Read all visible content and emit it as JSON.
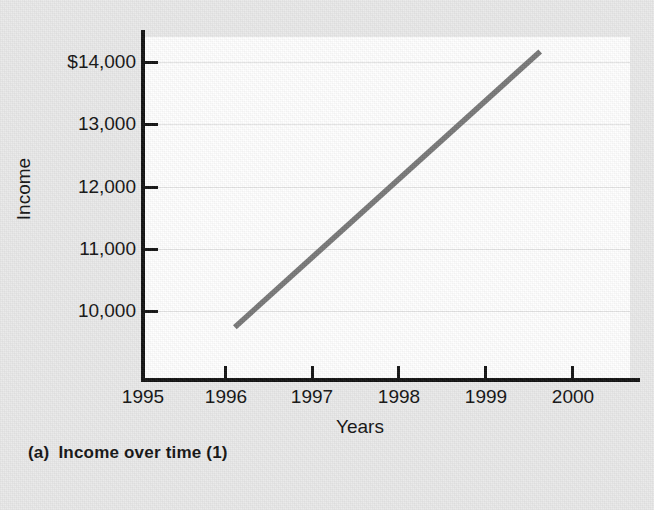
{
  "figure": {
    "caption_tag": "(a)",
    "caption_text": "Income over time (1)"
  },
  "axes": {
    "y_title": "Income",
    "x_title": "Years"
  },
  "colors": {
    "line": "#777777",
    "axis": "#111111",
    "grid": "#e4e4e4",
    "plot_background": "#ffffff",
    "page_background": "#e9e9e9"
  },
  "chart_data": {
    "type": "line",
    "title": "Income over time (1)",
    "xlabel": "Years",
    "ylabel": "Income",
    "xlim": [
      1995,
      2000.4
    ],
    "ylim": [
      9400,
      14600
    ],
    "grid": true,
    "legend": "none",
    "x_tick_labels": [
      "1995",
      "1996",
      "1997",
      "1998",
      "1999",
      "2000"
    ],
    "x_ticks": [
      1995,
      1996,
      1997,
      1998,
      1999,
      2000
    ],
    "y_tick_labels": [
      "$14,000",
      "13,000",
      "12,000",
      "11,000",
      "10,000"
    ],
    "y_ticks": [
      14000,
      13000,
      12000,
      11000,
      10000
    ],
    "series": [
      {
        "name": "Income",
        "color": "#777777",
        "x": [
          1996,
          1999.4
        ],
        "values": [
          10200,
          14380
        ]
      }
    ]
  }
}
